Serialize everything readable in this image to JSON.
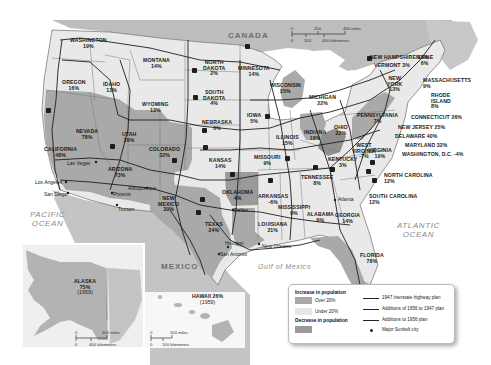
{
  "map": {
    "title_hidden": "Population change by state with interstate highway plans",
    "colors": {
      "over20": "#a9a9a9",
      "under20": "#e9e9e9",
      "decrease": "#9a9a9a",
      "water": "#ffffff",
      "foreign_land": "#c4c4c4",
      "canada": "#bdbdbd",
      "highway": "#1e1e1e"
    },
    "countries": {
      "canada": "CANADA",
      "mexico": "MEXICO"
    },
    "water_bodies": {
      "pacific": "PACIFIC\nOCEAN",
      "pacific_line1": "PACIFIC",
      "pacific_line2": "OCEAN",
      "atlantic_line1": "ATLANTIC",
      "atlantic_line2": "OCEAN",
      "gulf": "Gulf of Mexico"
    },
    "states": [
      {
        "name": "WASHINGTON",
        "pct": "19%",
        "category": "under20"
      },
      {
        "name": "OREGON",
        "pct": "16%",
        "category": "under20"
      },
      {
        "name": "IDAHO",
        "pct": "13%",
        "category": "under20"
      },
      {
        "name": "MONTANA",
        "pct": "14%",
        "category": "under20"
      },
      {
        "name": "WYOMING",
        "pct": "13%",
        "category": "under20"
      },
      {
        "name": "NORTH DAKOTA",
        "pct": "2%",
        "category": "under20"
      },
      {
        "name": "SOUTH DAKOTA",
        "pct": "4%",
        "category": "under20"
      },
      {
        "name": "NEBRASKA",
        "pct": "6%",
        "category": "under20"
      },
      {
        "name": "KANSAS",
        "pct": "14%",
        "category": "under20"
      },
      {
        "name": "MINNESOTA",
        "pct": "14%",
        "category": "under20"
      },
      {
        "name": "IOWA",
        "pct": "5%",
        "category": "under20"
      },
      {
        "name": "WISCONSIN",
        "pct": "15%",
        "category": "under20"
      },
      {
        "name": "MICHIGAN",
        "pct": "22%",
        "category": "over20"
      },
      {
        "name": "ILLINOIS",
        "pct": "15%",
        "category": "under20"
      },
      {
        "name": "INDIANA",
        "pct": "18%",
        "category": "under20"
      },
      {
        "name": "OHIO",
        "pct": "22%",
        "category": "over20"
      },
      {
        "name": "MISSOURI",
        "pct": "9%",
        "category": "under20"
      },
      {
        "name": "KENTUCKY",
        "pct": "3%",
        "category": "under20"
      },
      {
        "name": "WEST VIRGINIA",
        "pct": "-7%",
        "category": "decrease"
      },
      {
        "name": "VIRGINIA",
        "pct": "19%",
        "category": "under20"
      },
      {
        "name": "TENNESSEE",
        "pct": "8%",
        "category": "under20"
      },
      {
        "name": "NORTH CAROLINA",
        "pct": "12%",
        "category": "under20"
      },
      {
        "name": "SOUTH CAROLINA",
        "pct": "12%",
        "category": "under20"
      },
      {
        "name": "GEORGIA",
        "pct": "14%",
        "category": "under20"
      },
      {
        "name": "ALABAMA",
        "pct": "6%",
        "category": "under20"
      },
      {
        "name": "MISSISSIPPI",
        "pct": "0%",
        "category": "under20"
      },
      {
        "name": "LOUISIANA",
        "pct": "21%",
        "category": "over20"
      },
      {
        "name": "ARKANSAS",
        "pct": "-6%",
        "category": "decrease"
      },
      {
        "name": "OKLAHOMA",
        "pct": "4%",
        "category": "under20"
      },
      {
        "name": "TEXAS",
        "pct": "24%",
        "category": "over20"
      },
      {
        "name": "NEW MEXICO",
        "pct": "39%",
        "category": "over20"
      },
      {
        "name": "ARIZONA",
        "pct": "73%",
        "category": "over20"
      },
      {
        "name": "COLORADO",
        "pct": "32%",
        "category": "over20"
      },
      {
        "name": "UTAH",
        "pct": "29%",
        "category": "over20"
      },
      {
        "name": "NEVADA",
        "pct": "78%",
        "category": "over20"
      },
      {
        "name": "CALIFORNIA",
        "pct": "48%",
        "category": "over20"
      },
      {
        "name": "FLORIDA",
        "pct": "78%",
        "category": "over20"
      },
      {
        "name": "PENNSYLVANIA",
        "pct": "7%",
        "category": "under20"
      },
      {
        "name": "NEW YORK",
        "pct": "13%",
        "category": "under20"
      },
      {
        "name": "NEW HAMPSHIRE",
        "pct": "13%",
        "category": "under20"
      },
      {
        "name": "VERMONT",
        "pct": "3%",
        "category": "under20"
      },
      {
        "name": "MAINE",
        "pct": "6%",
        "category": "under20"
      },
      {
        "name": "MASSACHUSETTS",
        "pct": "9%",
        "category": "under20"
      },
      {
        "name": "RHODE ISLAND",
        "pct": "8%",
        "category": "under20"
      },
      {
        "name": "CONNECTICUT",
        "pct": "26%",
        "category": "over20"
      },
      {
        "name": "NEW JERSEY",
        "pct": "25%",
        "category": "over20"
      },
      {
        "name": "DELAWARE",
        "pct": "40%",
        "category": "over20"
      },
      {
        "name": "MARYLAND",
        "pct": "32%",
        "category": "over20"
      },
      {
        "name": "WASHINGTON, D.C.",
        "pct": "-4%",
        "category": "decrease"
      },
      {
        "name": "ALASKA",
        "pct": "75%",
        "note": "(1959)",
        "category": "over20"
      },
      {
        "name": "HAWAII",
        "pct": "26%",
        "note": "(1959)",
        "category": "over20"
      }
    ],
    "labels": {
      "washington": "WASHINGTON",
      "washington_pct": "19%",
      "oregon": "OREGON",
      "oregon_pct": "16%",
      "idaho": "IDAHO",
      "idaho_pct": "13%",
      "montana": "MONTANA",
      "montana_pct": "14%",
      "wyoming": "WYOMING",
      "wyoming_pct": "13%",
      "north_dakota_1": "NORTH",
      "north_dakota_2": "DAKOTA",
      "north_dakota_pct": "2%",
      "south_dakota_1": "SOUTH",
      "south_dakota_2": "DAKOTA",
      "south_dakota_pct": "4%",
      "nebraska": "NEBRASKA",
      "nebraska_pct": "6%",
      "kansas": "KANSAS",
      "kansas_pct": "14%",
      "minnesota": "MINNESOTA",
      "minnesota_pct": "14%",
      "iowa": "IOWA",
      "iowa_pct": "5%",
      "wisconsin": "WISCONSIN",
      "wisconsin_pct": "15%",
      "michigan": "MICHIGAN",
      "michigan_pct": "22%",
      "illinois": "ILLINOIS",
      "illinois_pct": "15%",
      "indiana": "INDIANA",
      "indiana_pct": "18%",
      "ohio": "OHIO",
      "ohio_pct": "22%",
      "missouri": "MISSOURI",
      "missouri_pct": "9%",
      "kentucky": "KENTUCKY",
      "kentucky_pct": "3%",
      "west_virginia_1": "WEST",
      "west_virginia_2": "VIRGINIA",
      "west_virginia_pct": "-7%",
      "virginia": "VIRGINIA",
      "virginia_pct": "19%",
      "tennessee": "TENNESSEE",
      "tennessee_pct": "8%",
      "north_carolina": "NORTH CAROLINA",
      "north_carolina_pct": "12%",
      "south_carolina": "SOUTH CAROLINA",
      "south_carolina_pct": "12%",
      "georgia": "GEORGIA",
      "georgia_pct": "14%",
      "alabama": "ALABAMA",
      "alabama_pct": "6%",
      "mississippi": "MISSISSIPPI",
      "mississippi_pct": "0%",
      "louisiana": "LOUISIANA",
      "louisiana_pct": "21%",
      "arkansas": "ARKANSAS",
      "arkansas_pct": "-6%",
      "oklahoma": "OKLAHOMA",
      "oklahoma_pct": "4%",
      "texas": "TEXAS",
      "texas_pct": "24%",
      "new_mexico_1": "NEW",
      "new_mexico_2": "MEXICO",
      "new_mexico_pct": "39%",
      "arizona": "ARIZONA",
      "arizona_pct": "73%",
      "colorado": "COLORADO",
      "colorado_pct": "32%",
      "utah": "UTAH",
      "utah_pct": "29%",
      "nevada": "NEVADA",
      "nevada_pct": "78%",
      "california": "CALIFORNIA",
      "california_pct": "48%",
      "florida": "FLORIDA",
      "florida_pct": "78%",
      "pennsylvania": "PENNSYLVANIA",
      "pennsylvania_pct": "7%",
      "new_york_1": "NEW",
      "new_york_2": "YORK",
      "new_york_pct": "13%",
      "new_hampshire": "NEW HAMPSHIRE 13%",
      "vermont": "VERMONT 3%",
      "maine": "MAINE",
      "maine_pct": "6%",
      "massachusetts": "MASSACHUSETTS",
      "massachusetts_pct": "9%",
      "rhode_island_1": "RHODE",
      "rhode_island_2": "ISLAND",
      "rhode_island_pct": "8%",
      "connecticut": "CONNECTICUT 26%",
      "new_jersey": "NEW JERSEY 25%",
      "delaware": "DELAWARE 40%",
      "maryland": "MARYLAND 32%",
      "dc": "WASHINGTON, D.C. -4%",
      "alaska": "ALASKA",
      "alaska_pct": "75%",
      "alaska_note": "(1959)",
      "hawaii": "HAWAII 26%",
      "hawaii_note": "(1959)"
    },
    "cities": {
      "los_angeles": "Los Angeles",
      "san_diego": "San Diego",
      "las_vegas": "Las Vegas",
      "phoenix": "Phoenix",
      "tucson": "Tucson",
      "albuquerque": "Albuquerque",
      "dallas": "Dallas",
      "houston": "Houston",
      "san_antonio": "San Antonio",
      "new_orleans": "New Orleans",
      "atlanta": "Atlanta",
      "miami": "Miami"
    },
    "scales": {
      "main_miles": [
        "0",
        "200",
        "400 miles"
      ],
      "main_km": [
        "0",
        "200",
        "400 kilometers"
      ],
      "alaska_miles": [
        "0",
        "400 miles"
      ],
      "alaska_km": [
        "0",
        "400 kilometers"
      ],
      "hawaii_miles": [
        "0",
        "100 miles"
      ],
      "hawaii_km": [
        "0",
        "100 kilometers"
      ]
    },
    "legend": {
      "increase_heading": "Increase in population",
      "over20": "Over 20%",
      "under20": "Under 20%",
      "decrease_heading": "Decrease in population",
      "line1947": "1947 interstate highway plan",
      "line1956to1947": "Additions of 1956 to 1947 plan",
      "line1956": "Additions to 1956 plan",
      "sunbelt": "Major Sunbelt city"
    },
    "icons": [
      "interstate-shield-icon",
      "city-dot-icon",
      "scale-bar-icon"
    ]
  }
}
